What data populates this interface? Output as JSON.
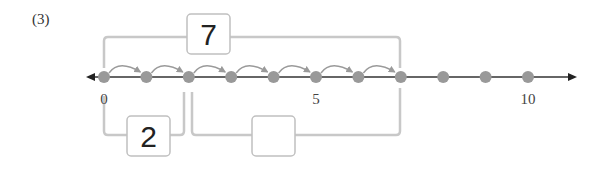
{
  "problem": {
    "label": "(3)"
  },
  "number_line": {
    "min": 0,
    "max": 10,
    "tick_labels": [
      {
        "value": 0,
        "label": "0"
      },
      {
        "value": 5,
        "label": "5"
      },
      {
        "value": 10,
        "label": "10"
      }
    ],
    "points": [
      0,
      1,
      2,
      3,
      4,
      5,
      6,
      7,
      8,
      9,
      10
    ],
    "hops": {
      "from": 0,
      "to": 7,
      "count": 7
    },
    "colors": {
      "axis": "#333333",
      "dot": "#999999",
      "hop_arrow": "#9a9a9a",
      "bracket": "#c8c8c8",
      "box_border": "#c0c0c0"
    }
  },
  "boxes": {
    "total": {
      "value": "7",
      "spans": [
        0,
        7
      ]
    },
    "part_a": {
      "value": "2",
      "spans": [
        0,
        2
      ]
    },
    "part_b": {
      "value": "",
      "spans": [
        2,
        7
      ]
    }
  }
}
